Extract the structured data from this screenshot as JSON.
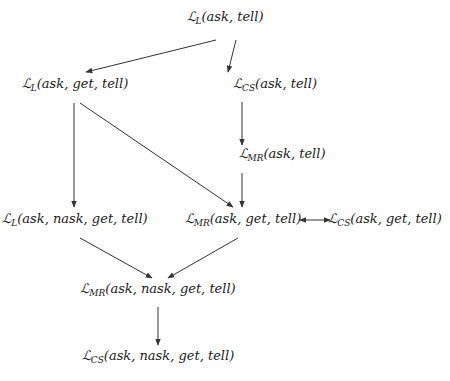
{
  "diagram": {
    "nodes": [
      {
        "id": "n1",
        "symbol": "ℒ",
        "sub": "L",
        "args": "(ask, tell)",
        "x": 225,
        "y": 18
      },
      {
        "id": "n2",
        "symbol": "ℒ",
        "sub": "L",
        "args": "(ask, get, tell)",
        "x": 75,
        "y": 85
      },
      {
        "id": "n3",
        "symbol": "ℒ",
        "sub": "CS",
        "args": "(ask, tell)",
        "x": 275,
        "y": 85
      },
      {
        "id": "n4",
        "symbol": "ℒ",
        "sub": "MR",
        "args": "(ask, tell)",
        "x": 282,
        "y": 155
      },
      {
        "id": "n5",
        "symbol": "ℒ",
        "sub": "L",
        "args": "(ask, nask, get, tell)",
        "x": 75,
        "y": 220
      },
      {
        "id": "n6",
        "symbol": "ℒ",
        "sub": "MR",
        "args": "(ask, get, tell)",
        "x": 243,
        "y": 220
      },
      {
        "id": "n7",
        "symbol": "ℒ",
        "sub": "CS",
        "args": "(ask, get, tell)",
        "x": 385,
        "y": 220
      },
      {
        "id": "n8",
        "symbol": "ℒ",
        "sub": "MR",
        "args": "(ask, nask, get, tell)",
        "x": 158,
        "y": 290
      },
      {
        "id": "n9",
        "symbol": "ℒ",
        "sub": "CS",
        "args": "(ask, nask, get, tell)",
        "x": 158,
        "y": 357
      }
    ],
    "edges": [
      {
        "from": "n1",
        "to": "n2",
        "x1": 216,
        "y1": 40,
        "x2": 86,
        "y2": 72,
        "type": "arrow"
      },
      {
        "from": "n1",
        "to": "n3",
        "x1": 236,
        "y1": 40,
        "x2": 228,
        "y2": 72,
        "type": "arrow"
      },
      {
        "from": "n3",
        "to": "n4",
        "x1": 242,
        "y1": 102,
        "x2": 242,
        "y2": 145,
        "type": "arrow"
      },
      {
        "from": "n2",
        "to": "n5",
        "x1": 74,
        "y1": 103,
        "x2": 74,
        "y2": 207,
        "type": "arrow"
      },
      {
        "from": "n2",
        "to": "n6",
        "x1": 80,
        "y1": 103,
        "x2": 233,
        "y2": 207,
        "type": "arrow"
      },
      {
        "from": "n4",
        "to": "n6",
        "x1": 242,
        "y1": 173,
        "x2": 242,
        "y2": 207,
        "type": "arrow"
      },
      {
        "from": "n6",
        "to": "n7",
        "x1": 300,
        "y1": 220,
        "x2": 330,
        "y2": 220,
        "type": "double"
      },
      {
        "from": "n5",
        "to": "n8",
        "x1": 80,
        "y1": 238,
        "x2": 152,
        "y2": 278,
        "type": "arrow"
      },
      {
        "from": "n6",
        "to": "n8",
        "x1": 238,
        "y1": 238,
        "x2": 168,
        "y2": 278,
        "type": "arrow"
      },
      {
        "from": "n8",
        "to": "n9",
        "x1": 158,
        "y1": 307,
        "x2": 158,
        "y2": 345,
        "type": "arrow"
      }
    ],
    "colors": {
      "line": "#333333",
      "text": "#1a1a1a",
      "background": "#ffffff"
    }
  }
}
